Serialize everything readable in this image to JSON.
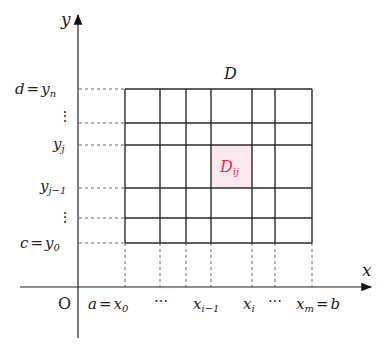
{
  "diagram": {
    "title_region": "D",
    "highlight_cell": {
      "label": "D",
      "sub": "ij",
      "color": "#e0304a",
      "fill": "#fbe8f0"
    },
    "axes": {
      "x_label": "x",
      "y_label": "y",
      "origin": "O"
    },
    "y_ticks": [
      {
        "lhs": "d",
        "eq": "=",
        "var": "y",
        "sub": "n"
      },
      {
        "dots": "⋮"
      },
      {
        "var": "y",
        "sub": "j"
      },
      {
        "var": "y",
        "sub": "j−1"
      },
      {
        "dots": "⋮"
      },
      {
        "lhs": "c",
        "eq": "=",
        "var": "y",
        "sub": "0"
      }
    ],
    "x_ticks": [
      {
        "lhs": "a",
        "eq": "=",
        "var": "x",
        "sub": "0"
      },
      {
        "dots": "⋯"
      },
      {
        "var": "x",
        "sub": "i−1"
      },
      {
        "var": "x",
        "sub": "i"
      },
      {
        "dots": "⋯"
      },
      {
        "var": "x",
        "sub": "m",
        "eq": "=",
        "rhs": "b"
      }
    ],
    "grid_x": [
      125,
      160,
      186,
      211,
      252,
      275,
      312
    ],
    "grid_y": [
      89,
      123,
      145,
      188,
      218,
      243
    ]
  }
}
